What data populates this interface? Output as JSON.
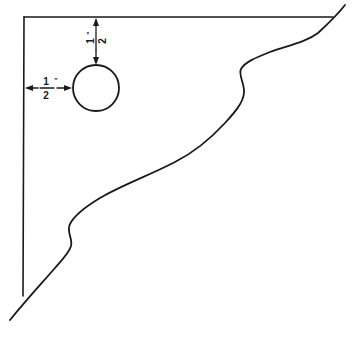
{
  "diagram": {
    "colors": {
      "ink": "#1a1a1a",
      "background": "#ffffff"
    },
    "dimensions": {
      "vertical": {
        "numerator": "1",
        "denominator": "2",
        "unit": "\"",
        "meaning": "hole offset from top edge"
      },
      "horizontal": {
        "numerator": "1",
        "denominator": "2",
        "unit": "\"",
        "meaning": "hole offset from left edge"
      }
    },
    "shapes": {
      "top_edge": "straight line",
      "left_edge": "straight line",
      "hole": "circle",
      "diagonal_edge": "wavy S-curved freehand edge"
    }
  }
}
